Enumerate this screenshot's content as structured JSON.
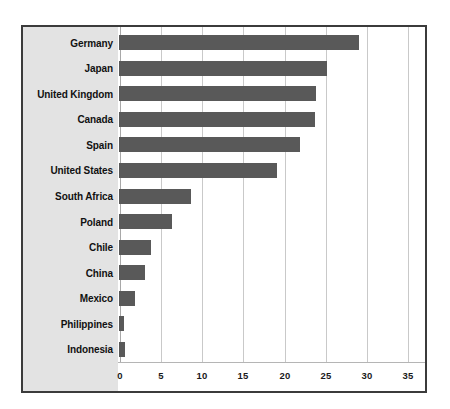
{
  "chart_data": {
    "type": "bar",
    "orientation": "horizontal",
    "title": "",
    "xlabel": "",
    "ylabel": "",
    "xlim": [
      0,
      35
    ],
    "xticks": [
      0,
      5,
      10,
      15,
      20,
      25,
      30,
      35
    ],
    "xtick_labels": [
      "0",
      "5",
      "10",
      "15",
      "20",
      "25",
      "30",
      "35"
    ],
    "grid": true,
    "legend": false,
    "categories": [
      "Germany",
      "Japan",
      "United Kingdom",
      "Canada",
      "Spain",
      "United States",
      "South Africa",
      "Poland",
      "Chile",
      "China",
      "Mexico",
      "Philippines",
      "Indonesia"
    ],
    "values": [
      29.2,
      25.3,
      23.9,
      23.8,
      22.0,
      19.2,
      8.8,
      6.5,
      3.9,
      3.1,
      1.9,
      0.6,
      0.7
    ],
    "bar_color": "#595959",
    "panel_color": "#e3e3e3",
    "gridline_color": "#c9c9c9",
    "border_color": "#3b3b3b",
    "background_color": "#ffffff"
  }
}
